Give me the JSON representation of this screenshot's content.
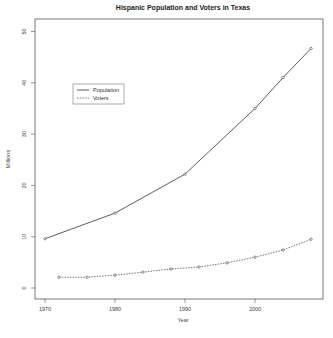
{
  "chart_data": {
    "type": "line",
    "title": "Hispanic Population and Voters in Texas",
    "xlabel": "Year",
    "ylabel": "Millions",
    "xlim": [
      1968.5,
      2009.5
    ],
    "ylim": [
      -1.5,
      52
    ],
    "x_ticks": [
      1970,
      1980,
      1990,
      2000
    ],
    "y_ticks": [
      0,
      10,
      20,
      30,
      40,
      50
    ],
    "grid": false,
    "legend_position": "upper-left (inside)",
    "series": [
      {
        "name": "Population",
        "style": "solid",
        "color": "#333333",
        "x": [
          1970,
          1980,
          1990,
          2000,
          2004,
          2008
        ],
        "values": [
          9.6,
          14.6,
          22.2,
          35.0,
          41.0,
          46.7
        ]
      },
      {
        "name": "Voters",
        "style": "dashed",
        "color": "#555555",
        "x": [
          1972,
          1976,
          1980,
          1984,
          1988,
          1992,
          1996,
          2000,
          2004,
          2008
        ],
        "values": [
          2.1,
          2.1,
          2.5,
          3.1,
          3.7,
          4.1,
          4.9,
          6.0,
          7.4,
          9.5
        ]
      }
    ]
  }
}
